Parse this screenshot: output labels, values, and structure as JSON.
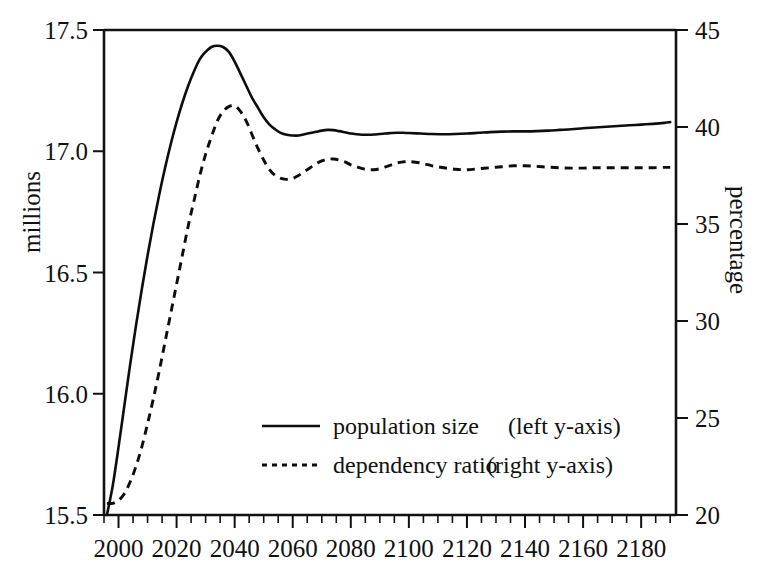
{
  "chart_data": {
    "type": "line",
    "title": "",
    "subtitle": "",
    "xlabel": "",
    "ylabel": "millions",
    "y2label": "percentage",
    "xlim": [
      1995,
      2192
    ],
    "ylim": [
      15.5,
      17.5
    ],
    "y2lim": [
      20,
      45
    ],
    "grid": false,
    "legend_position": "center",
    "x_ticks": [
      "2000",
      "2020",
      "2040",
      "2060",
      "2080",
      "2100",
      "2120",
      "2140",
      "2160",
      "2180"
    ],
    "x_tick_values": [
      2000,
      2020,
      2040,
      2060,
      2080,
      2100,
      2120,
      2140,
      2160,
      2180
    ],
    "x_minor_tick_step": 5,
    "y_ticks": [
      "15.5",
      "16.0",
      "16.5",
      "17.0",
      "17.5"
    ],
    "y_tick_values": [
      15.5,
      16.0,
      16.5,
      17.0,
      17.5
    ],
    "y2_ticks": [
      "20",
      "25",
      "30",
      "35",
      "40",
      "45"
    ],
    "y2_tick_values": [
      20,
      25,
      30,
      35,
      40,
      45
    ],
    "series": [
      {
        "name": "population size",
        "axis": "left",
        "style": "solid",
        "x": [
          1996,
          1998,
          2000,
          2002,
          2004,
          2006,
          2008,
          2010,
          2012,
          2014,
          2016,
          2018,
          2020,
          2022,
          2024,
          2026,
          2028,
          2030,
          2032,
          2034,
          2036,
          2038,
          2040,
          2042,
          2044,
          2046,
          2048,
          2050,
          2052,
          2054,
          2056,
          2058,
          2060,
          2062,
          2064,
          2066,
          2068,
          2070,
          2072,
          2074,
          2076,
          2078,
          2080,
          2082,
          2084,
          2086,
          2088,
          2090,
          2092,
          2094,
          2096,
          2098,
          2100,
          2104,
          2108,
          2112,
          2116,
          2120,
          2124,
          2128,
          2132,
          2136,
          2140,
          2144,
          2148,
          2152,
          2156,
          2160,
          2164,
          2168,
          2172,
          2176,
          2180,
          2184,
          2188,
          2190
        ],
        "values": [
          15.5,
          15.62,
          15.78,
          15.95,
          16.12,
          16.28,
          16.43,
          16.57,
          16.7,
          16.82,
          16.93,
          17.03,
          17.12,
          17.2,
          17.27,
          17.33,
          17.38,
          17.41,
          17.43,
          17.435,
          17.43,
          17.41,
          17.37,
          17.32,
          17.27,
          17.22,
          17.18,
          17.14,
          17.11,
          17.09,
          17.075,
          17.068,
          17.065,
          17.065,
          17.07,
          17.075,
          17.08,
          17.085,
          17.088,
          17.087,
          17.083,
          17.078,
          17.073,
          17.07,
          17.068,
          17.068,
          17.069,
          17.071,
          17.073,
          17.075,
          17.076,
          17.076,
          17.075,
          17.073,
          17.071,
          17.07,
          17.071,
          17.073,
          17.076,
          17.079,
          17.081,
          17.082,
          17.082,
          17.083,
          17.085,
          17.088,
          17.091,
          17.095,
          17.098,
          17.101,
          17.104,
          17.107,
          17.11,
          17.113,
          17.117,
          17.12
        ]
      },
      {
        "name": "dependency ratio",
        "axis": "right",
        "style": "dashed",
        "x": [
          1996,
          1998,
          2000,
          2002,
          2004,
          2006,
          2008,
          2010,
          2012,
          2014,
          2016,
          2018,
          2020,
          2022,
          2024,
          2026,
          2028,
          2030,
          2032,
          2034,
          2036,
          2038,
          2040,
          2042,
          2044,
          2046,
          2048,
          2050,
          2052,
          2054,
          2056,
          2058,
          2060,
          2062,
          2064,
          2066,
          2068,
          2070,
          2072,
          2074,
          2076,
          2078,
          2080,
          2082,
          2084,
          2086,
          2088,
          2090,
          2092,
          2094,
          2096,
          2098,
          2100,
          2104,
          2108,
          2112,
          2116,
          2120,
          2124,
          2128,
          2132,
          2136,
          2140,
          2144,
          2148,
          2152,
          2156,
          2160,
          2164,
          2168,
          2172,
          2176,
          2180,
          2184,
          2188,
          2190
        ],
        "values": [
          20.6,
          20.6,
          20.75,
          21.1,
          21.7,
          22.5,
          23.5,
          24.7,
          26.0,
          27.4,
          28.9,
          30.4,
          31.9,
          33.4,
          34.9,
          36.2,
          37.5,
          38.6,
          39.5,
          40.3,
          40.8,
          41.05,
          41.1,
          40.8,
          40.3,
          39.6,
          38.9,
          38.3,
          37.8,
          37.5,
          37.35,
          37.3,
          37.35,
          37.5,
          37.7,
          37.9,
          38.1,
          38.25,
          38.35,
          38.35,
          38.3,
          38.2,
          38.05,
          37.95,
          37.85,
          37.8,
          37.8,
          37.85,
          37.95,
          38.05,
          38.15,
          38.2,
          38.22,
          38.15,
          38.0,
          37.9,
          37.82,
          37.8,
          37.85,
          37.9,
          37.95,
          38.0,
          38.0,
          37.97,
          37.93,
          37.9,
          37.88,
          37.88,
          37.9,
          37.9,
          37.9,
          37.9,
          37.9,
          37.9,
          37.92,
          37.92
        ]
      }
    ],
    "legend": [
      {
        "line_style": "solid",
        "label": "population size",
        "axis_note": "(left y-axis)"
      },
      {
        "line_style": "dashed",
        "label": "dependency ratio",
        "axis_note": "(right y-axis)"
      }
    ],
    "annotations": []
  }
}
